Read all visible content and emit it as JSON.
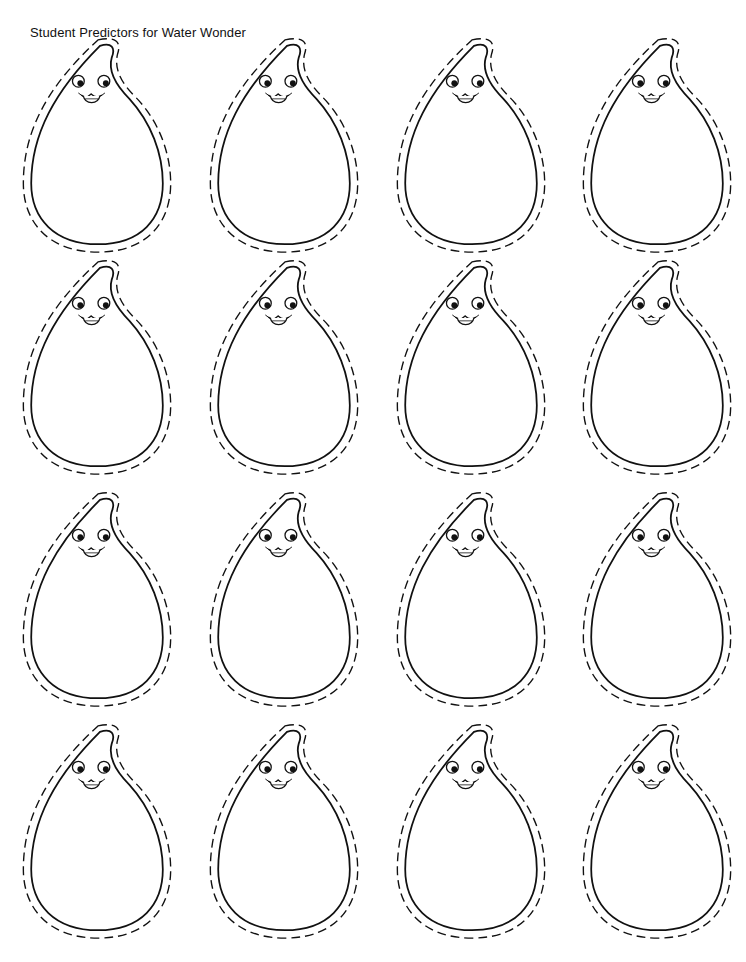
{
  "page": {
    "title": "Student Predictors for Water Wonder",
    "ink_color": "#111111",
    "background": "#ffffff"
  },
  "grid": {
    "rows": 4,
    "columns": 4,
    "drops": [
      {
        "row": 1,
        "col": 1,
        "label": ""
      },
      {
        "row": 1,
        "col": 2,
        "label": ""
      },
      {
        "row": 1,
        "col": 3,
        "label": ""
      },
      {
        "row": 1,
        "col": 4,
        "label": ""
      },
      {
        "row": 2,
        "col": 1,
        "label": ""
      },
      {
        "row": 2,
        "col": 2,
        "label": ""
      },
      {
        "row": 2,
        "col": 3,
        "label": ""
      },
      {
        "row": 2,
        "col": 4,
        "label": ""
      },
      {
        "row": 3,
        "col": 1,
        "label": ""
      },
      {
        "row": 3,
        "col": 2,
        "label": ""
      },
      {
        "row": 3,
        "col": 3,
        "label": ""
      },
      {
        "row": 3,
        "col": 4,
        "label": ""
      },
      {
        "row": 4,
        "col": 1,
        "label": ""
      },
      {
        "row": 4,
        "col": 2,
        "label": ""
      },
      {
        "row": 4,
        "col": 3,
        "label": ""
      },
      {
        "row": 4,
        "col": 4,
        "label": ""
      }
    ],
    "icon": "water-drop-face-icon"
  }
}
